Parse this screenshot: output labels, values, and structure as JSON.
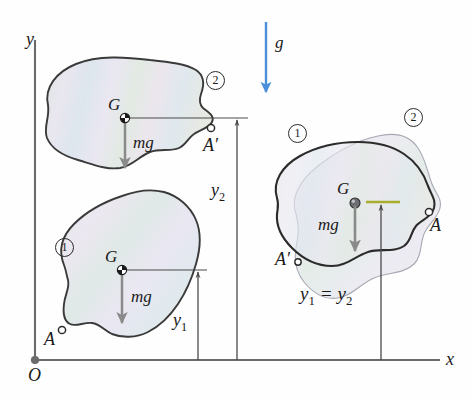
{
  "figure": {
    "axes": {
      "x_label": "x",
      "y_label": "y",
      "origin_label": "O",
      "axis_color": "#6b6b6b"
    },
    "gravity": {
      "label": "g",
      "color": "#4a90d9",
      "direction": "down"
    },
    "left_group": {
      "upper_body": {
        "position_badge": "2",
        "center_of_mass_label": "G",
        "weight_label": "mg",
        "point_label": "A′"
      },
      "lower_body": {
        "position_badge": "1",
        "center_of_mass_label": "G",
        "weight_label": "mg",
        "point_label": "A"
      },
      "dimensions": [
        {
          "label": "y",
          "subscript": "1"
        },
        {
          "label": "y",
          "subscript": "2"
        }
      ]
    },
    "right_group": {
      "body_one_badge": "1",
      "body_two_badge": "2",
      "center_of_mass_label": "G",
      "weight_label": "mg",
      "point_a_label": "A",
      "point_a_prime_label": "A′",
      "datum_color": "#a8ad2c",
      "equation": "y₁ = y₂",
      "equation_parts": {
        "left": "y",
        "left_sub": "1",
        "op": "=",
        "right": "y",
        "right_sub": "2"
      }
    },
    "colors": {
      "body_outline": "#3a3a3a",
      "body_fill_a": "#e8e6f2",
      "body_fill_b": "#e4eeea",
      "arrow_gray": "#8a8a8a",
      "marker_ring": "#2b2b2b",
      "gravity_blue": "#4a90d9",
      "datum_olive": "#a8ad2c"
    }
  }
}
